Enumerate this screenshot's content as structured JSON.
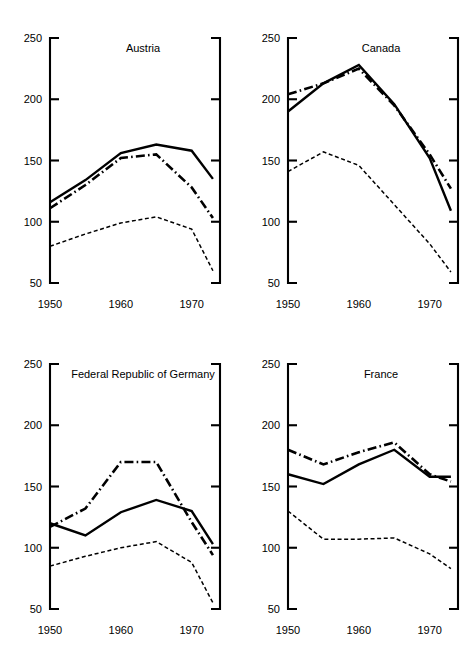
{
  "figure": {
    "layout": "2x2 grid of line panels",
    "panel_order": [
      "austria",
      "canada",
      "germany",
      "france"
    ]
  },
  "axis": {
    "y_ticks": [
      50,
      100,
      150,
      200,
      250
    ],
    "y_tick_labels": [
      "50",
      "100",
      "150",
      "200",
      "250"
    ],
    "x_ticks": [
      1950,
      1960,
      1970
    ],
    "x_tick_labels": [
      "1950",
      "1960",
      "1970"
    ],
    "ylim": [
      50,
      250
    ],
    "xlim": [
      1950,
      1974
    ],
    "grid": false,
    "left_spine": "bracket",
    "right_spine": "bracket"
  },
  "chart_data": [
    {
      "type": "line",
      "title": "Austria",
      "xlabel": "",
      "ylabel": "",
      "xlim": [
        1950,
        1974
      ],
      "ylim": [
        50,
        250
      ],
      "grid": false,
      "legend": "none",
      "x": [
        1950,
        1955,
        1960,
        1965,
        1970,
        1973
      ],
      "series": [
        {
          "name": "solid",
          "style": "solid",
          "values": [
            116,
            134,
            156,
            163,
            158,
            135
          ]
        },
        {
          "name": "dash-dot",
          "style": "dash-dot",
          "values": [
            111,
            130,
            152,
            155,
            128,
            103
          ]
        },
        {
          "name": "dashed",
          "style": "dashed",
          "values": [
            80,
            90,
            99,
            104,
            94,
            60
          ]
        }
      ]
    },
    {
      "type": "line",
      "title": "Canada",
      "xlabel": "",
      "ylabel": "",
      "xlim": [
        1950,
        1974
      ],
      "ylim": [
        50,
        250
      ],
      "grid": false,
      "legend": "none",
      "x": [
        1950,
        1955,
        1960,
        1965,
        1970,
        1973
      ],
      "series": [
        {
          "name": "solid",
          "style": "solid",
          "values": [
            190,
            213,
            228,
            196,
            152,
            109
          ]
        },
        {
          "name": "dash-dot",
          "style": "dash-dot",
          "values": [
            204,
            213,
            225,
            195,
            155,
            127
          ]
        },
        {
          "name": "dashed",
          "style": "dashed",
          "values": [
            141,
            157,
            146,
            114,
            82,
            59
          ]
        }
      ]
    },
    {
      "type": "line",
      "title": "Federal Republic of Germany",
      "xlabel": "",
      "ylabel": "",
      "xlim": [
        1950,
        1974
      ],
      "ylim": [
        50,
        250
      ],
      "grid": false,
      "legend": "none",
      "x": [
        1950,
        1955,
        1960,
        1965,
        1970,
        1973
      ],
      "series": [
        {
          "name": "solid",
          "style": "solid",
          "values": [
            120,
            110,
            129,
            139,
            130,
            103
          ]
        },
        {
          "name": "dash-dot",
          "style": "dash-dot",
          "values": [
            117,
            132,
            170,
            170,
            121,
            94
          ]
        },
        {
          "name": "dashed",
          "style": "dashed",
          "values": [
            85,
            93,
            100,
            105,
            88,
            55
          ]
        }
      ]
    },
    {
      "type": "line",
      "title": "France",
      "xlabel": "",
      "ylabel": "",
      "xlim": [
        1950,
        1974
      ],
      "ylim": [
        50,
        250
      ],
      "grid": false,
      "legend": "none",
      "x": [
        1950,
        1955,
        1960,
        1965,
        1970,
        1973
      ],
      "series": [
        {
          "name": "solid",
          "style": "solid",
          "values": [
            160,
            152,
            168,
            180,
            158,
            158
          ]
        },
        {
          "name": "dash-dot",
          "style": "dash-dot",
          "values": [
            180,
            168,
            178,
            186,
            160,
            154
          ]
        },
        {
          "name": "dashed",
          "style": "dashed",
          "values": [
            130,
            107,
            107,
            108,
            95,
            83
          ]
        }
      ]
    }
  ]
}
